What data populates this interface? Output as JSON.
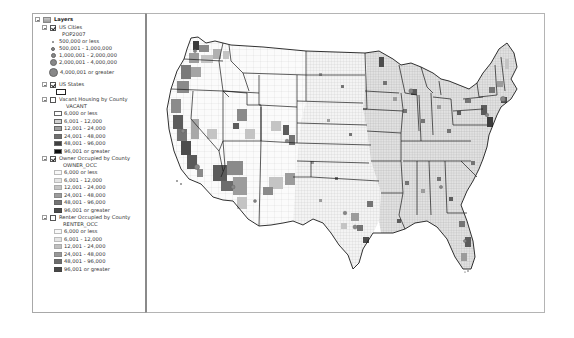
{
  "toc": {
    "root": {
      "label": "Layers",
      "expanded": true
    },
    "layers": [
      {
        "name": "US Cities",
        "checked": true,
        "field": "POP2007",
        "classes": [
          {
            "label": "500,000 or less",
            "size": 2,
            "color": "#888888"
          },
          {
            "label": "500,001 - 1,000,000",
            "size": 4,
            "color": "#888888"
          },
          {
            "label": "1,000,001 - 2,000,000",
            "size": 5,
            "color": "#888888"
          },
          {
            "label": "2,000,001 - 4,000,000",
            "size": 7,
            "color": "#888888"
          },
          {
            "label": "4,000,001 or greater",
            "size": 9,
            "color": "#888888"
          }
        ]
      },
      {
        "name": "US States",
        "checked": true,
        "symbol": "hollow-polygon"
      },
      {
        "name": "Vacant Housing by County",
        "checked": false,
        "field": "VACANT",
        "classes": [
          {
            "label": "6,000 or less",
            "color": "#ffffff"
          },
          {
            "label": "6,001 - 12,000",
            "color": "#d0d0d0"
          },
          {
            "label": "12,001 - 24,000",
            "color": "#a0a0a0"
          },
          {
            "label": "24,001 - 48,000",
            "color": "#707070"
          },
          {
            "label": "48,001 - 96,000",
            "color": "#404040"
          },
          {
            "label": "96,001 or greater",
            "color": "#101010"
          }
        ]
      },
      {
        "name": "Owner Occupied by County",
        "checked": true,
        "field": "OWNER_OCC",
        "classes": [
          {
            "label": "6,000 or less",
            "color": "#f8f8f8"
          },
          {
            "label": "6,001 - 12,000",
            "color": "#e4e4e4"
          },
          {
            "label": "12,001 - 24,000",
            "color": "#c4c4c4"
          },
          {
            "label": "24,001 - 48,000",
            "color": "#9c9c9c"
          },
          {
            "label": "48,001 - 96,000",
            "color": "#747474"
          },
          {
            "label": "96,001 or greater",
            "color": "#4c4c4c"
          }
        ]
      },
      {
        "name": "Renter Occupied by County",
        "checked": false,
        "field": "RENTER_OCC",
        "classes": [
          {
            "label": "6,000 or less",
            "color": "#f8f8f8"
          },
          {
            "label": "6,001 - 12,000",
            "color": "#e4e4e4"
          },
          {
            "label": "12,001 - 24,000",
            "color": "#c0c0c0"
          },
          {
            "label": "24,001 - 48,000",
            "color": "#989898"
          },
          {
            "label": "48,001 - 96,000",
            "color": "#6c6c6c"
          },
          {
            "label": "96,001 or greater",
            "color": "#484848"
          }
        ]
      }
    ]
  },
  "map": {
    "title": "Owner Occupied by County",
    "state_outline_color": "#1a1a1a",
    "background": "#ffffff"
  }
}
